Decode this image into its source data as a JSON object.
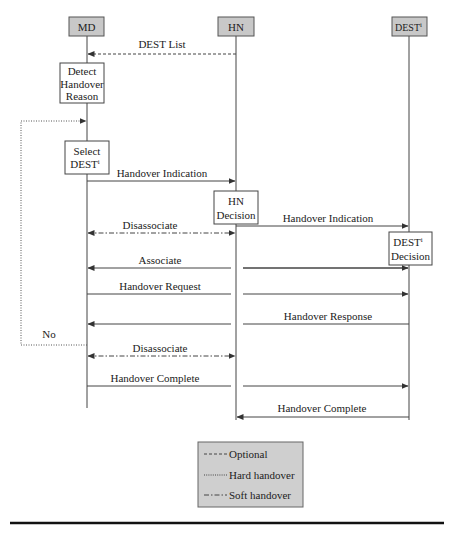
{
  "colors": {
    "header_fill": "#c8c8c8",
    "legend_fill": "#cfcfcf",
    "line": "#333333",
    "box_fill": "#ffffff"
  },
  "actors": [
    {
      "id": "md",
      "label": "MD",
      "sup": ""
    },
    {
      "id": "hn",
      "label": "HN",
      "sup": ""
    },
    {
      "id": "dest",
      "label": "DEST",
      "sup": "i"
    }
  ],
  "process_boxes": {
    "detect": {
      "lines": [
        "Detect",
        "Handover",
        "Reason"
      ]
    },
    "select": {
      "lines": [
        "Select",
        "DEST"
      ],
      "sup": "i"
    },
    "hn_decision": {
      "lines": [
        "HN",
        "Decision"
      ]
    },
    "dest_decision": {
      "lines": [
        "DEST",
        "Decision"
      ],
      "sup": "i"
    }
  },
  "messages": [
    {
      "label": "DEST List",
      "from": "HN",
      "to": "MD",
      "style": "optional"
    },
    {
      "label": "Handover Indication",
      "from": "MD",
      "to": "HN",
      "style": "solid"
    },
    {
      "label": "Disassociate",
      "from": "HN",
      "to": "MD",
      "style": "soft",
      "bidirectional": true
    },
    {
      "label": "Handover Indication",
      "from": "HN",
      "to": "DEST",
      "style": "solid"
    },
    {
      "label": "Associate",
      "from": "DEST",
      "to": "MD",
      "style": "solid"
    },
    {
      "label": "Handover Request",
      "from": "MD",
      "to": "DEST",
      "style": "solid"
    },
    {
      "label": "Handover Response",
      "from": "DEST",
      "to": "MD",
      "style": "solid"
    },
    {
      "label": "Disassociate",
      "from": "MD",
      "to": "HN",
      "style": "soft",
      "bidirectional": true
    },
    {
      "label": "Handover Complete",
      "from": "MD",
      "to": "DEST",
      "style": "solid"
    },
    {
      "label": "Handover Complete",
      "from": "DEST",
      "to": "HN",
      "style": "solid"
    }
  ],
  "loop": {
    "label": "No",
    "style": "hard"
  },
  "legend": {
    "items": [
      {
        "style": "optional",
        "label": "Optional"
      },
      {
        "style": "hard",
        "label": "Hard handover"
      },
      {
        "style": "soft",
        "label": "Soft handover"
      }
    ]
  }
}
